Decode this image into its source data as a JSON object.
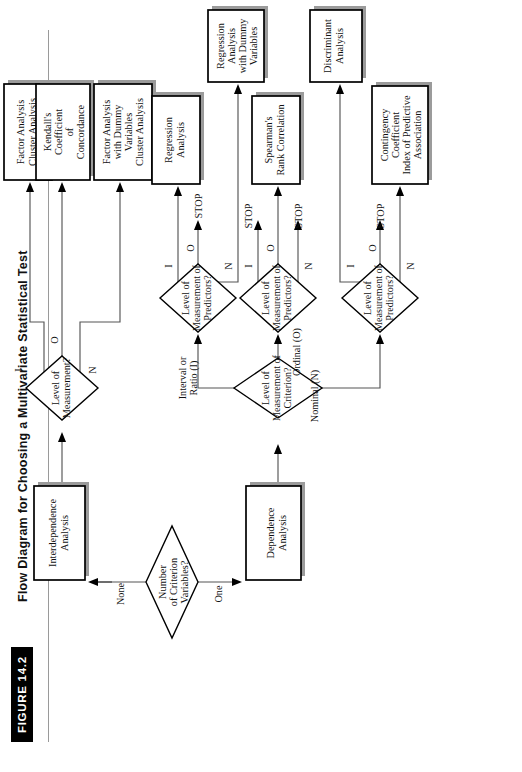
{
  "figure": {
    "tag": "FIGURE 14.2",
    "title": "Flow Diagram for Choosing a Multivariate Statistical Test"
  },
  "nodes": {
    "start_decision": {
      "lines": [
        "Number",
        "of Criterion",
        "Variables?"
      ]
    },
    "interdependence": {
      "lines": [
        "Interdependence",
        "Analysis"
      ]
    },
    "dependence": {
      "lines": [
        "Dependence",
        "Analysis"
      ]
    },
    "level_measurement": {
      "lines": [
        "Level of",
        "Measurement?"
      ]
    },
    "level_criterion": {
      "lines": [
        "Level of",
        "Measurement of",
        "Criterion?"
      ]
    },
    "pred_interval": {
      "lines": [
        "Level of",
        "Measurement of",
        "Predictors?"
      ]
    },
    "pred_ordinal": {
      "lines": [
        "Level of",
        "Measurement of",
        "Predictors?"
      ]
    },
    "pred_nominal": {
      "lines": [
        "Level of",
        "Measurement of",
        "Predictors?"
      ]
    }
  },
  "outcomes": {
    "factor_cluster": {
      "lines": [
        "Factor Analysis",
        "Cluster Analysis"
      ]
    },
    "kendall": {
      "lines": [
        "Kendall's",
        "Coefficient",
        "of",
        "Concordance"
      ]
    },
    "factor_dummy": {
      "lines": [
        "Factor Analysis",
        "with Dummy",
        "Variables",
        "Cluster Analysis"
      ]
    },
    "regression": {
      "lines": [
        "Regression",
        "Analysis"
      ]
    },
    "regression_dummy": {
      "lines": [
        "Regression",
        "Analysis",
        "with Dummy",
        "Variables"
      ]
    },
    "spearman": {
      "lines": [
        "Spearman's",
        "Rank Correlation"
      ]
    },
    "discriminant": {
      "lines": [
        "Discriminant",
        "Analysis"
      ]
    },
    "contingency": {
      "lines": [
        "Contingency",
        "Coefficient",
        "Index of Predictive",
        "Association"
      ]
    }
  },
  "edge_labels": {
    "none": "None",
    "one": "One",
    "lm_i": "I",
    "lm_o": "O",
    "lm_n": "N",
    "interval_or_ratio": [
      "Interval or",
      "Ratio (I)"
    ],
    "ordinal": "Ordinal (O)",
    "nominal": "Nominal (N)",
    "p1_i": "I",
    "p1_o": "O",
    "p1_n": "N",
    "p2_i": "I",
    "p2_o": "O",
    "p2_n": "N",
    "p3_i": "I",
    "p3_o": "O",
    "p3_n": "N"
  },
  "stops": {
    "s1": "STOP",
    "s2": "STOP",
    "s3": "STOP",
    "s4": "STOP",
    "s5": "STOP"
  },
  "colors": {
    "line": "#555555",
    "box_stroke": "#000000",
    "shadow": "#9b9b9b",
    "tag_bg": "#000000",
    "rule": "#9a9a9a"
  }
}
